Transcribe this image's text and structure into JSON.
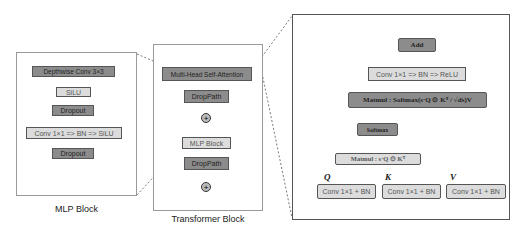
{
  "mlp_block": {
    "caption": "MLP Block",
    "layers": [
      "Depthwise Conv 3×3",
      "SiLU",
      "Dropout",
      "Conv 1×1 => BN => SiLU",
      "Dropout"
    ]
  },
  "transformer_block": {
    "caption": "Transformer Block",
    "layers": [
      "Multi-Head Self-Attention",
      "DropPath",
      "MLP Block",
      "DropPath"
    ],
    "add_symbol": "+"
  },
  "attention_block": {
    "add": "Add",
    "conv_out": "Conv 1×1 => BN => ReLU",
    "matmul_v": "Matmul :  Softmax(s·Q ⊙ Kᵀ / √dₖ)V",
    "softmax": "Softmax",
    "matmul_qk": "Matmul :  s·Q ⊙ Kᵀ",
    "q_label": "Q",
    "k_label": "K",
    "v_label": "V",
    "conv_q": "Conv 1×1 + BN",
    "conv_k": "Conv 1×1 + BN",
    "conv_v": "Conv 1×1 + BN"
  }
}
